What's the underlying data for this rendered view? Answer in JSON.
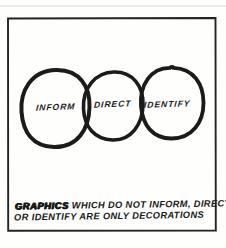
{
  "page": {
    "kind": "hand-drawn sketch panel",
    "paper_color": "#fefefd",
    "ink_color": "#1b1b19"
  },
  "diagram": {
    "circles": [
      {
        "label": "INFORM"
      },
      {
        "label": "DIRECT"
      },
      {
        "label": "IDENTIFY"
      }
    ],
    "caption": {
      "emphasis": "GRAPHICS",
      "line1_rest": "WHICH DO NOT INFORM, DIRECT,",
      "line2": "OR IDENTIFY ARE ONLY DECORATIONS"
    }
  }
}
